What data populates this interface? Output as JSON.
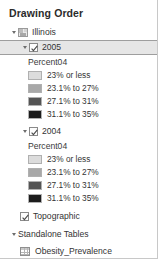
{
  "panel": {
    "title": "Drawing Order"
  },
  "tree": {
    "map_group": {
      "label": "Illinois",
      "icon": "map-layers-icon",
      "expanded": true
    },
    "layers": [
      {
        "label": "2005",
        "checked": true,
        "selected": true,
        "expanded": true,
        "field_name": "Percent04",
        "legend": [
          {
            "label": "23% or less",
            "color": "#dcdcdc"
          },
          {
            "label": "23.1% to 27%",
            "color": "#a8a8a8"
          },
          {
            "label": "27.1% to 31%",
            "color": "#545454"
          },
          {
            "label": "31.1% to 35%",
            "color": "#1c1c1c"
          }
        ]
      },
      {
        "label": "2004",
        "checked": true,
        "selected": false,
        "expanded": true,
        "field_name": "Percent04",
        "legend": [
          {
            "label": "23% or less",
            "color": "#dcdcdc"
          },
          {
            "label": "23.1% to 27%",
            "color": "#a8a8a8"
          },
          {
            "label": "27.1% to 31%",
            "color": "#545454"
          },
          {
            "label": "31.1% to 35%",
            "color": "#1c1c1c"
          }
        ]
      }
    ],
    "basemap": {
      "label": "Topographic",
      "checked": true
    },
    "standalone_tables": {
      "label": "Standalone Tables",
      "expanded": true,
      "items": [
        {
          "label": "Obesity_Prevalence",
          "icon": "table-icon"
        }
      ]
    }
  },
  "colors": {
    "selection_fill": "#e6e6e6",
    "selection_border": "#9e9e9e",
    "text": "#333333",
    "panel_border": "#c8c8c8"
  }
}
